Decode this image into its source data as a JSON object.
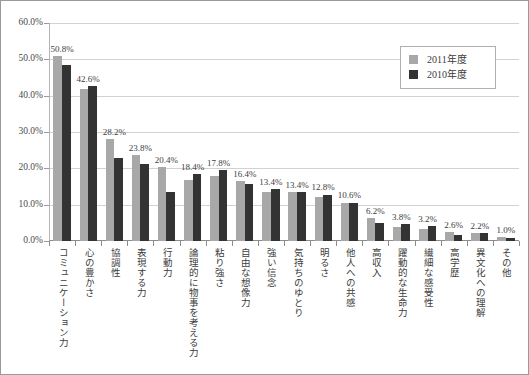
{
  "chart_data": {
    "type": "bar",
    "title": "",
    "xlabel": "",
    "ylabel": "",
    "ylim": [
      0,
      60
    ],
    "ytick_labels": [
      "0.0%",
      "10.0%",
      "20.0%",
      "30.0%",
      "40.0%",
      "50.0%",
      "60.0%"
    ],
    "ytick_values": [
      0,
      10,
      20,
      30,
      40,
      50,
      60
    ],
    "grid": true,
    "legend_position": "top-right",
    "categories": [
      "コミュニケーション力",
      "心の豊かさ",
      "協調性",
      "表現する力",
      "行動力",
      "論理的に物事を考える力",
      "粘り強さ",
      "自由な想像力",
      "強い信念",
      "気持ちのゆとり",
      "明るさ",
      "他人への共感",
      "高収入",
      "躍動的な生命力",
      "繊細な感受性",
      "高学歴",
      "異文化への理解",
      "その他"
    ],
    "series": [
      {
        "name": "2011年度",
        "color": "#a8a8a8",
        "values": [
          50.8,
          41.8,
          28.2,
          23.8,
          20.4,
          16.8,
          17.8,
          16.4,
          13.4,
          13.4,
          12.2,
          10.6,
          6.2,
          3.8,
          3.2,
          2.6,
          2.2,
          1.0
        ]
      },
      {
        "name": "2010年度",
        "color": "#333333",
        "values": [
          48.4,
          42.6,
          22.8,
          21.2,
          13.6,
          18.4,
          19.6,
          15.8,
          14.2,
          13.4,
          12.8,
          10.6,
          5.0,
          4.6,
          4.0,
          1.6,
          2.2,
          0.8
        ]
      }
    ],
    "data_labels": [
      "50.8%",
      "42.6%",
      "28.2%",
      "23.8%",
      "20.4%",
      "18.4%",
      "17.8%",
      "16.4%",
      "13.4%",
      "13.4%",
      "12.8%",
      "10.6%",
      "6.2%",
      "3.8%",
      "3.2%",
      "2.6%",
      "2.2%",
      "1.0%"
    ]
  },
  "legend": {
    "items": [
      {
        "label": "2011年度",
        "color": "#a8a8a8"
      },
      {
        "label": "2010年度",
        "color": "#333333"
      }
    ]
  }
}
